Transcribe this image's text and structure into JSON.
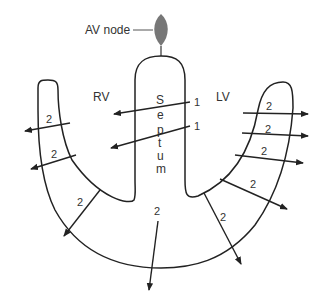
{
  "labels": {
    "av_node": "AV node",
    "rv": "RV",
    "lv": "LV",
    "septum_letters": [
      "S",
      "e",
      "p",
      "t",
      "u",
      "m"
    ]
  },
  "septal_arrows": [
    {
      "label": "1"
    },
    {
      "label": "1"
    }
  ],
  "wall_arrows": [
    {
      "label": "2",
      "region": "rv-upper"
    },
    {
      "label": "2",
      "region": "rv-middle"
    },
    {
      "label": "2",
      "region": "rv-lower"
    },
    {
      "label": "2",
      "region": "apex"
    },
    {
      "label": "2",
      "region": "lv-lower"
    },
    {
      "label": "2",
      "region": "lv-lower-mid"
    },
    {
      "label": "2",
      "region": "lv-middle"
    },
    {
      "label": "2",
      "region": "lv-upper-mid"
    },
    {
      "label": "2",
      "region": "lv-upper"
    }
  ],
  "colors": {
    "outline": "#222222",
    "av_node_fill": "#777777",
    "text": "#333333"
  }
}
